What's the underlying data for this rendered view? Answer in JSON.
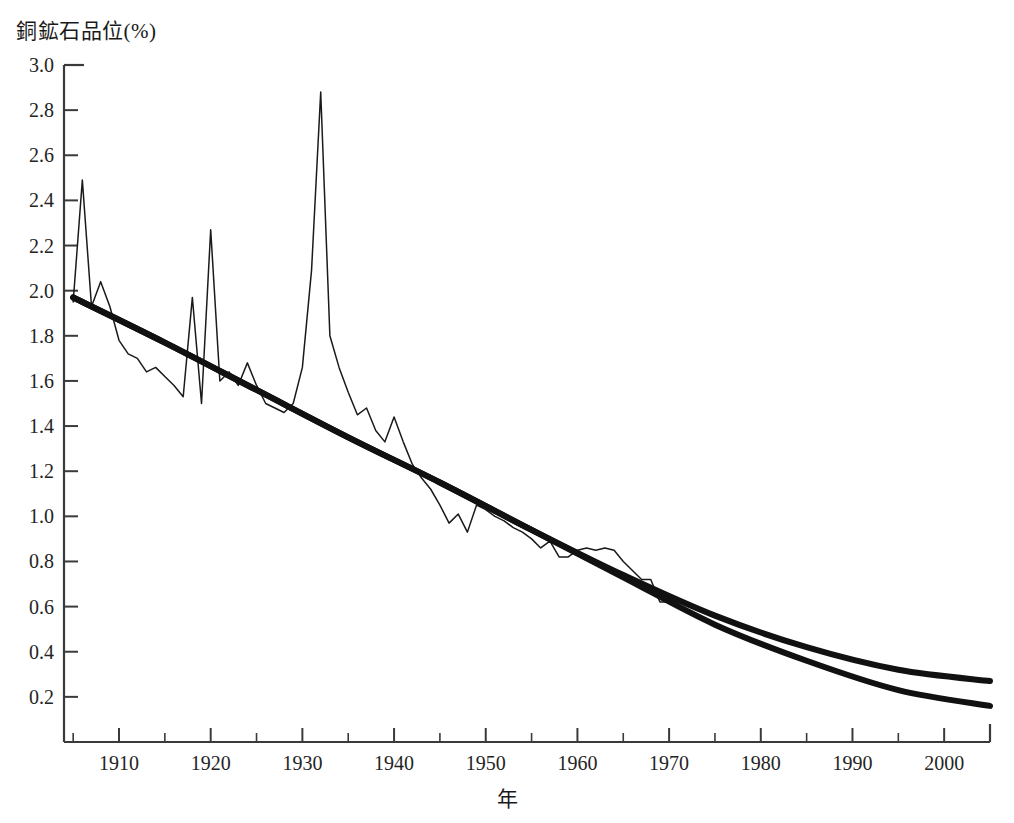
{
  "chart_data": {
    "type": "line",
    "title": "",
    "ylabel": "銅鉱石品位(%)",
    "xlabel": "年",
    "xlim": [
      1904,
      2005
    ],
    "ylim": [
      0.0,
      3.0
    ],
    "grid": false,
    "legend_position": "none",
    "y_ticks": [
      3.0,
      2.8,
      2.6,
      2.4,
      2.2,
      2.0,
      1.8,
      1.6,
      1.4,
      1.2,
      1.0,
      0.8,
      0.6,
      0.4,
      0.2
    ],
    "y_tick_labels": [
      "3.0",
      "2.8",
      "2.6",
      "2.4",
      "2.2",
      "2.0",
      "1.8",
      "1.6",
      "1.4",
      "1.2",
      "1.0",
      "0.8",
      "0.6",
      "0.4",
      "0.2"
    ],
    "x_ticks": [
      1910,
      1920,
      1930,
      1940,
      1950,
      1960,
      1970,
      1980,
      1990,
      2000
    ],
    "x_tick_labels": [
      "1910",
      "1920",
      "1930",
      "1940",
      "1950",
      "1960",
      "1970",
      "1980",
      "1990",
      "2000"
    ],
    "x_minor_ticks": [
      1905,
      1915,
      1925,
      1935,
      1945,
      1955,
      1965,
      1975,
      1985,
      1995,
      2005
    ],
    "series": [
      {
        "name": "観測値（銅鉱石品位）",
        "style": "thin-line",
        "color": "#1a1a1a",
        "x": [
          1905,
          1906,
          1907,
          1908,
          1909,
          1910,
          1911,
          1912,
          1913,
          1914,
          1915,
          1916,
          1917,
          1918,
          1919,
          1920,
          1921,
          1922,
          1923,
          1924,
          1925,
          1926,
          1927,
          1928,
          1929,
          1930,
          1931,
          1932,
          1933,
          1934,
          1935,
          1936,
          1937,
          1938,
          1939,
          1940,
          1941,
          1942,
          1943,
          1944,
          1945,
          1946,
          1947,
          1948,
          1949,
          1950,
          1951,
          1952,
          1953,
          1954,
          1955,
          1956,
          1957,
          1958,
          1959,
          1960,
          1961,
          1962,
          1963,
          1964,
          1965,
          1966,
          1967,
          1968,
          1969,
          1970
        ],
        "y": [
          1.95,
          2.49,
          1.93,
          2.04,
          1.93,
          1.78,
          1.72,
          1.7,
          1.64,
          1.66,
          1.62,
          1.58,
          1.53,
          1.97,
          1.5,
          2.27,
          1.6,
          1.64,
          1.58,
          1.68,
          1.58,
          1.5,
          1.48,
          1.46,
          1.5,
          1.66,
          2.09,
          2.88,
          1.8,
          1.66,
          1.55,
          1.45,
          1.48,
          1.38,
          1.33,
          1.44,
          1.33,
          1.23,
          1.17,
          1.12,
          1.05,
          0.97,
          1.01,
          0.93,
          1.05,
          1.03,
          1.0,
          0.98,
          0.95,
          0.93,
          0.9,
          0.86,
          0.89,
          0.82,
          0.82,
          0.85,
          0.86,
          0.85,
          0.86,
          0.85,
          0.8,
          0.76,
          0.72,
          0.72,
          0.62,
          0.62
        ]
      },
      {
        "name": "回帰曲線（上）",
        "style": "thick-line",
        "color": "#111111",
        "x": [
          1905,
          1915,
          1925,
          1935,
          1945,
          1955,
          1965,
          1975,
          1985,
          1995,
          2005
        ],
        "y": [
          1.97,
          1.77,
          1.56,
          1.35,
          1.15,
          0.94,
          0.74,
          0.56,
          0.42,
          0.32,
          0.27
        ]
      },
      {
        "name": "回帰曲線（下）",
        "style": "thick-line",
        "color": "#111111",
        "x": [
          1905,
          1915,
          1925,
          1935,
          1945,
          1955,
          1965,
          1975,
          1985,
          1995,
          2005
        ],
        "y": [
          1.97,
          1.77,
          1.56,
          1.35,
          1.15,
          0.94,
          0.73,
          0.52,
          0.36,
          0.23,
          0.16
        ]
      }
    ],
    "annotations": [
      {
        "label": "1906年ピーク",
        "x": 1906,
        "y": 2.49
      },
      {
        "label": "1920年ピーク",
        "x": 1920,
        "y": 2.27
      },
      {
        "label": "1932年ピーク",
        "x": 1932,
        "y": 2.88
      }
    ]
  },
  "axes": {
    "frame_color": "#3a3a3a"
  }
}
